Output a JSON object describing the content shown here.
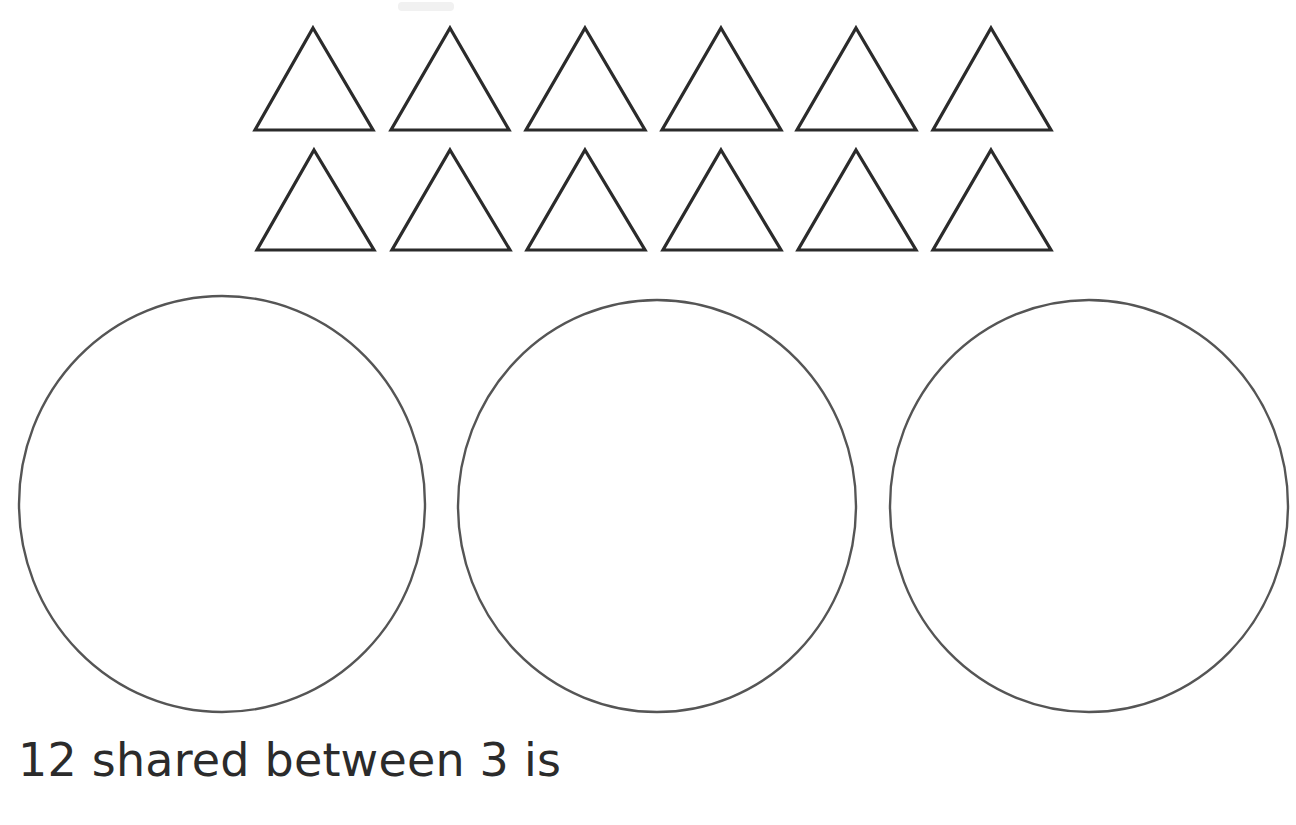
{
  "worksheet": {
    "background_color": "#ffffff",
    "shape_stroke_color_triangle": "#2b2b2b",
    "shape_stroke_color_circle": "#555555",
    "ink_color": "#2b2b2b"
  },
  "counters": {
    "label": "triangle counters",
    "total": 12,
    "rows": [
      {
        "label": "triangle row 1",
        "count": 6,
        "base_y": 130,
        "apex_y": 28,
        "triangles": [
          {
            "left": 255,
            "apex": 313,
            "right": 373
          },
          {
            "left": 391,
            "apex": 450,
            "right": 509
          },
          {
            "left": 526,
            "apex": 585,
            "right": 645
          },
          {
            "left": 662,
            "apex": 721,
            "right": 781
          },
          {
            "left": 797,
            "apex": 856,
            "right": 916
          },
          {
            "left": 933,
            "apex": 991,
            "right": 1051
          }
        ]
      },
      {
        "label": "triangle row 2",
        "count": 6,
        "base_y": 250,
        "apex_y": 150,
        "triangles": [
          {
            "left": 257,
            "apex": 314,
            "right": 374
          },
          {
            "left": 392,
            "apex": 450,
            "right": 510
          },
          {
            "left": 527,
            "apex": 585,
            "right": 645
          },
          {
            "left": 663,
            "apex": 721,
            "right": 781
          },
          {
            "left": 798,
            "apex": 856,
            "right": 916
          },
          {
            "left": 933,
            "apex": 991,
            "right": 1051
          }
        ]
      }
    ]
  },
  "groups": {
    "label": "sharing circles",
    "count": 3,
    "circles": [
      {
        "label": "circle 1",
        "cx": 222,
        "cy": 504,
        "rx": 203,
        "ry": 208
      },
      {
        "label": "circle 2",
        "cx": 657,
        "cy": 506,
        "rx": 199,
        "ry": 206
      },
      {
        "label": "circle 3",
        "cx": 1089,
        "cy": 506,
        "rx": 199,
        "ry": 206
      }
    ]
  },
  "sentence": {
    "text": "12 shared between 3 is",
    "terminator": ".",
    "answer_value": "",
    "answer_placeholder": ""
  },
  "chart_data": {
    "type": "table",
    "title": "12 shared between 3",
    "categories": [
      "triangle row 1",
      "triangle row 2"
    ],
    "values": [
      6,
      6
    ],
    "annotations": [
      "12 counters drawn as outlined triangles",
      "3 empty circles to share the counters between",
      "answer box left blank"
    ]
  }
}
